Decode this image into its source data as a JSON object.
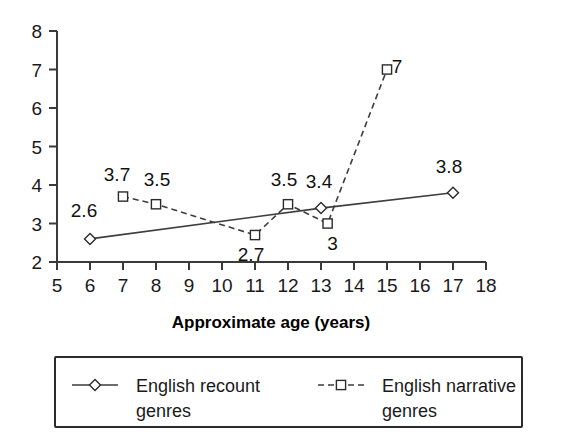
{
  "chart_data": {
    "type": "line",
    "title": "",
    "xlabel": "Approximate age (years)",
    "ylabel": "",
    "xlim": [
      5,
      18
    ],
    "ylim": [
      2,
      8
    ],
    "xticks": [
      5,
      6,
      7,
      8,
      9,
      10,
      11,
      12,
      13,
      14,
      15,
      16,
      17,
      18
    ],
    "yticks": [
      2,
      3,
      4,
      5,
      6,
      7,
      8
    ],
    "grid": false,
    "legend_position": "bottom",
    "series": [
      {
        "name": "English recount genres",
        "marker": "diamond",
        "line_style": "solid",
        "color": "#3d3d3d",
        "points": [
          {
            "x": 6,
            "y": 2.6,
            "label": "2.6",
            "label_dx": -6,
            "label_dy": -22
          },
          {
            "x": 13,
            "y": 3.4,
            "label": "3.4",
            "label_dx": -2,
            "label_dy": -20
          },
          {
            "x": 17,
            "y": 3.8,
            "label": "3.8",
            "label_dx": -4,
            "label_dy": -20
          }
        ]
      },
      {
        "name": "English narrative genres",
        "marker": "square",
        "line_style": "dashed",
        "color": "#3d3d3d",
        "points": [
          {
            "x": 7,
            "y": 3.7,
            "label": "3.7",
            "label_dx": -6,
            "label_dy": -16
          },
          {
            "x": 8,
            "y": 3.5,
            "label": "3.5",
            "label_dx": 1,
            "label_dy": -18
          },
          {
            "x": 11,
            "y": 2.7,
            "label": "2.7",
            "label_dx": -4,
            "label_dy": 26
          },
          {
            "x": 12,
            "y": 3.5,
            "label": "3.5",
            "label_dx": -4,
            "label_dy": -18
          },
          {
            "x": 13.2,
            "y": 3.0,
            "label": "3",
            "label_dx": 5,
            "label_dy": 26
          },
          {
            "x": 15,
            "y": 7.0,
            "label": "7",
            "label_dx": 10,
            "label_dy": 3
          }
        ]
      }
    ]
  },
  "axis": {
    "x_title": "Approximate age (years)",
    "x_tick_labels": [
      "5",
      "6",
      "7",
      "8",
      "9",
      "10",
      "11",
      "12",
      "13",
      "14",
      "15",
      "16",
      "17",
      "18"
    ],
    "y_tick_labels": [
      "8",
      "7",
      "6",
      "5",
      "4",
      "3",
      "2"
    ]
  },
  "legend": {
    "entries": [
      {
        "label_line1": "English recount",
        "label_line2": "genres",
        "marker": "diamond",
        "line_style": "solid"
      },
      {
        "label_line1": "English narrative",
        "label_line2": "genres",
        "marker": "square",
        "line_style": "dashed"
      }
    ]
  },
  "colors": {
    "axis": "#3a3a3a",
    "line": "#3d3d3d",
    "marker_stroke": "#2b2b2b",
    "text": "#1a1a1a",
    "background": "#ffffff"
  }
}
